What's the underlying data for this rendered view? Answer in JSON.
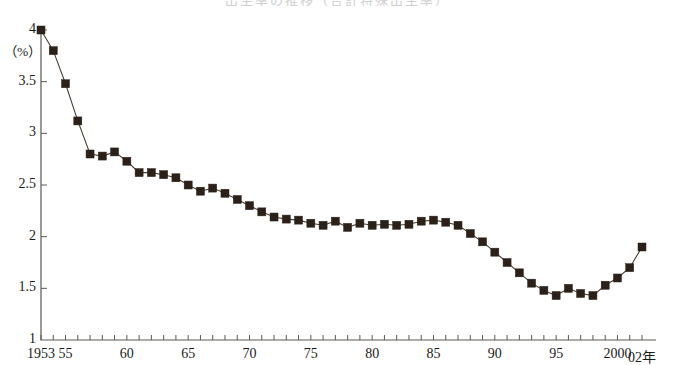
{
  "chart_data": {
    "type": "line",
    "title": "出生率の推移（合計特殊出生率）",
    "title_visible": false,
    "xlabel": "年",
    "ylabel": "",
    "unit_label": "（%）",
    "ylim": [
      1,
      4
    ],
    "yticks": [
      1,
      1.5,
      2,
      2.5,
      3,
      3.5,
      4
    ],
    "ytick_labels": [
      "1",
      "1.5",
      "2",
      "2.5",
      "3",
      "3.5",
      "4"
    ],
    "xlim": [
      1953,
      2002
    ],
    "xtick_labels": [
      "1953",
      "55",
      "60",
      "65",
      "70",
      "75",
      "80",
      "85",
      "90",
      "95",
      "2000",
      "02年"
    ],
    "xtick_years": [
      1953,
      1955,
      1960,
      1965,
      1970,
      1975,
      1980,
      1985,
      1990,
      1995,
      2000,
      2002
    ],
    "minor_tick_every": 1,
    "grid": false,
    "legend": false,
    "marker": "square",
    "marker_color": "#2b2118",
    "line_color": "#4a4036",
    "x": [
      1953,
      1954,
      1955,
      1956,
      1957,
      1958,
      1959,
      1960,
      1961,
      1962,
      1963,
      1964,
      1965,
      1966,
      1967,
      1968,
      1969,
      1970,
      1971,
      1972,
      1973,
      1974,
      1975,
      1976,
      1977,
      1978,
      1979,
      1980,
      1981,
      1982,
      1983,
      1984,
      1985,
      1986,
      1987,
      1988,
      1989,
      1990,
      1991,
      1992,
      1993,
      1994,
      1995,
      1996,
      1997,
      1998,
      1999,
      2000,
      2001,
      2002
    ],
    "values": [
      4.0,
      3.8,
      3.48,
      3.12,
      2.8,
      2.78,
      2.82,
      2.73,
      2.62,
      2.62,
      2.6,
      2.57,
      2.5,
      2.44,
      2.47,
      2.42,
      2.36,
      2.3,
      2.24,
      2.19,
      2.17,
      2.16,
      2.13,
      2.11,
      2.15,
      2.09,
      2.13,
      2.11,
      2.12,
      2.11,
      2.12,
      2.15,
      2.16,
      2.14,
      2.11,
      2.03,
      1.95,
      1.85,
      1.75,
      1.65,
      1.55,
      1.48,
      1.43,
      1.5,
      1.45,
      1.43,
      1.53,
      1.6,
      1.7,
      1.9
    ]
  },
  "axis": {
    "y_axis_name": "y-axis",
    "x_axis_name": "x-axis"
  }
}
